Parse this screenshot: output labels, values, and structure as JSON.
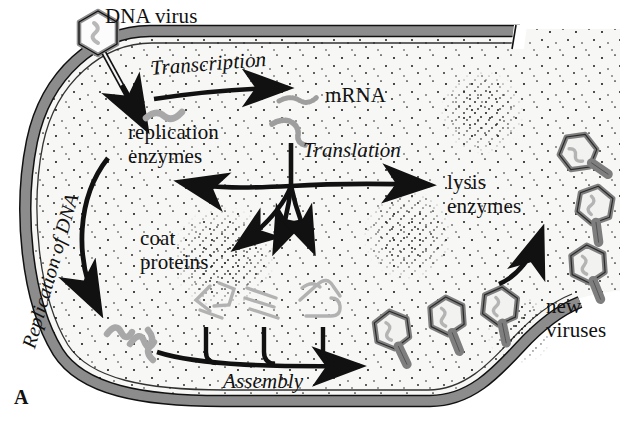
{
  "figure": {
    "panel_label": "A",
    "caption_title": "DNA virus lytic cycle",
    "colors": {
      "membrane_fill": "#8c8c8c",
      "membrane_stroke": "#111111",
      "cytoplasm": "#f7f7f5",
      "dna_gray": "#a8a8a8",
      "virus_gray": "#9a9a9a",
      "coat_gray": "#b0b0b0",
      "ink": "#111111",
      "stipple": "#1a1a1a"
    }
  },
  "labels": {
    "dna_virus": "DNA virus",
    "transcription": "Transcription",
    "mrna": "mRNA",
    "replication_enzymes_line1": "replication",
    "replication_enzymes_line2": "enzymes",
    "translation": "Translation",
    "lysis_enzymes_line1": "lysis",
    "lysis_enzymes_line2": "enzymes",
    "coat_proteins_line1": "coat",
    "coat_proteins_line2": "proteins",
    "replication_of_dna": "Replication of DNA",
    "assembly": "Assembly",
    "new_viruses_line1": "new",
    "new_viruses_line2": "viruses"
  },
  "process_steps": [
    {
      "id": "entry",
      "label": "DNA virus",
      "style": "plain"
    },
    {
      "id": "transcription",
      "label": "Transcription",
      "style": "italic"
    },
    {
      "id": "mrna",
      "label": "mRNA",
      "style": "plain"
    },
    {
      "id": "replication-enzymes",
      "label": "replication enzymes",
      "style": "plain"
    },
    {
      "id": "translation",
      "label": "Translation",
      "style": "italic"
    },
    {
      "id": "lysis-enzymes",
      "label": "lysis enzymes",
      "style": "plain"
    },
    {
      "id": "coat-proteins",
      "label": "coat proteins",
      "style": "plain"
    },
    {
      "id": "replication-of-dna",
      "label": "Replication of DNA",
      "style": "italic"
    },
    {
      "id": "assembly",
      "label": "Assembly",
      "style": "italic"
    },
    {
      "id": "new-viruses",
      "label": "new viruses",
      "style": "plain"
    }
  ],
  "particles": {
    "infecting_virus_count": 1,
    "mrna_strand_count": 2,
    "replicated_dna_count": 3,
    "coat_protein_cluster_count": 3,
    "assembled_virus_count": 3,
    "released_virus_count": 3
  }
}
